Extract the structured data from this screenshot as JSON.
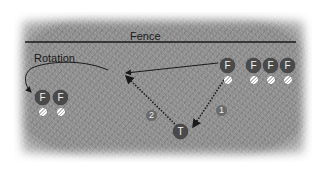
{
  "diagram": {
    "fence_label": "Fence",
    "rotation_label": "Rotation",
    "colors": {
      "grass": "#8e8e8e",
      "player": "#4a4a4a",
      "line": "#1a1a1a",
      "background": "#ffffff"
    },
    "players": [
      {
        "id": "f-throwing",
        "label": "F",
        "role": "fielder",
        "has_ball": true
      },
      {
        "id": "f-line-1",
        "label": "F",
        "role": "fielder",
        "has_ball": true
      },
      {
        "id": "f-line-2",
        "label": "F",
        "role": "fielder",
        "has_ball": true
      },
      {
        "id": "f-line-3",
        "label": "F",
        "role": "fielder",
        "has_ball": true
      },
      {
        "id": "f-rotated-1",
        "label": "F",
        "role": "fielder",
        "has_ball": true
      },
      {
        "id": "f-rotated-2",
        "label": "F",
        "role": "fielder",
        "has_ball": true
      },
      {
        "id": "thrower",
        "label": "T",
        "role": "thrower",
        "has_ball": false
      }
    ],
    "paths": [
      {
        "label": "1",
        "style": "dotted",
        "from": "fielder",
        "to": "thrower"
      },
      {
        "label": "2",
        "style": "dotted",
        "from": "thrower",
        "to": "fence area"
      },
      {
        "label": "",
        "style": "solid",
        "from": "fielder",
        "to": "fence area"
      },
      {
        "label": "",
        "style": "curved",
        "from": "rotation",
        "to": "rotated fielders"
      }
    ]
  }
}
